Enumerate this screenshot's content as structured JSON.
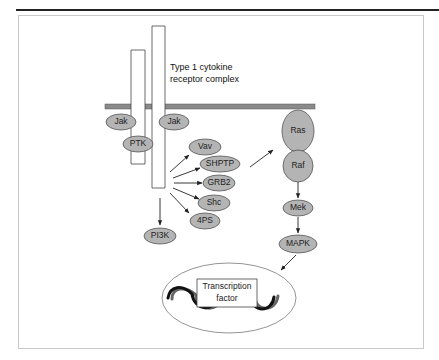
{
  "figure": {
    "receptor_label_line1": "Type 1 cytokine",
    "receptor_label_line2": "receptor complex",
    "transcription_label_line1": "Transcription",
    "transcription_label_line2": "factor"
  },
  "nodes": {
    "jak_left": "Jak",
    "jak_right": "Jak",
    "ptk": "PTK",
    "vav": "Vav",
    "shptp": "SHPTP",
    "grb2": "GRB2",
    "shc": "Shc",
    "fourps": "4PS",
    "pi3k": "PI3K",
    "ras": "Ras",
    "raf": "Raf",
    "mek": "Mek",
    "mapk": "MAPK"
  },
  "colors": {
    "node_fill": "#b4b4b4",
    "membrane": "#8a8a8a",
    "stroke": "#333333"
  }
}
